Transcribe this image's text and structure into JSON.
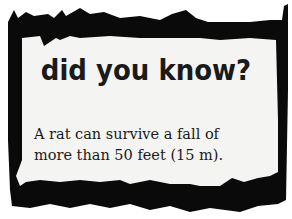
{
  "card": {
    "headline": "did you know?",
    "fact_line1": "A rat can survive a fall of",
    "fact_line2": "more than 50 feet (15 m).",
    "colors": {
      "border": "#0a0a0a",
      "paper": "#f4f4f2",
      "text": "#1a1a1a",
      "background": "#ffffff"
    }
  }
}
